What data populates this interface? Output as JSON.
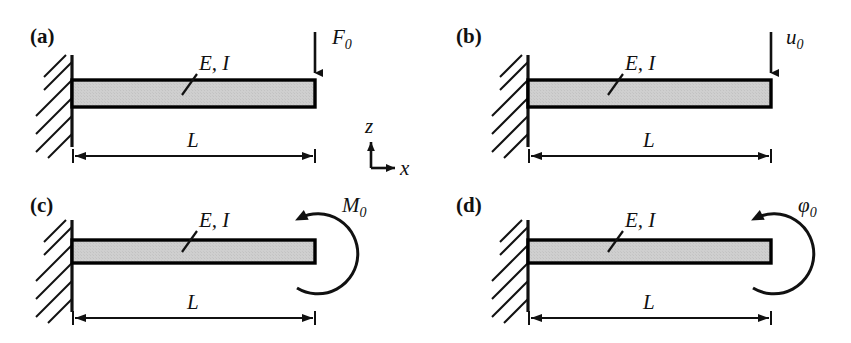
{
  "figure": {
    "type": "engineering-diagram",
    "background_color": "#ffffff",
    "ink_color": "#111111",
    "beam_fill_color": "#cccccc",
    "beam_edge_color": "#000000"
  },
  "coordinate_system": {
    "name": "coordinate-axes",
    "vertical_axis_label": "z",
    "vertical_axis_direction": "up",
    "horizontal_axis_label": "x",
    "horizontal_axis_direction": "right",
    "origin_x": 371,
    "origin_y": 158
  },
  "panels": [
    {
      "id": "a",
      "label": "(a)",
      "label_x": 30,
      "label_y": 43,
      "material_label": "E, I",
      "material_label_x": 196,
      "material_label_y": 68,
      "leader_x1": 182,
      "leader_y1": 95,
      "leader_x2": 196,
      "leader_y2": 76,
      "support": "fixed-wall",
      "wall_x": 72,
      "wall_top": 55,
      "wall_bottom": 147,
      "beam_x": 72,
      "beam_y": 80,
      "beam_width": 243,
      "beam_height": 27,
      "load": {
        "kind": "point-force",
        "symbol": "F",
        "subscript": "0",
        "label": "F0",
        "direction": "down",
        "arrow_x": 315,
        "arrow_y1": 32,
        "arrow_y2": 79,
        "label_x": 336,
        "label_y": 42
      },
      "dimension": {
        "label": "L",
        "label_x": 187,
        "label_y": 145,
        "line_y": 156,
        "x1": 73,
        "x2": 315
      }
    },
    {
      "id": "b",
      "label": "(b)",
      "label_x": 456,
      "label_y": 43,
      "material_label": "E, I",
      "material_label_x": 622,
      "material_label_y": 68,
      "leader_x1": 608,
      "leader_y1": 95,
      "leader_x2": 622,
      "leader_y2": 76,
      "support": "fixed-wall",
      "wall_x": 528,
      "wall_top": 55,
      "wall_bottom": 147,
      "beam_x": 528,
      "beam_y": 80,
      "beam_width": 243,
      "beam_height": 27,
      "load": {
        "kind": "prescribed-displacement",
        "symbol": "u",
        "subscript": "0",
        "label": "u0",
        "direction": "down",
        "arrow_x": 771,
        "arrow_y1": 32,
        "arrow_y2": 79,
        "label_x": 790,
        "label_y": 42
      },
      "dimension": {
        "label": "L",
        "label_x": 643,
        "label_y": 145,
        "line_y": 156,
        "x1": 529,
        "x2": 771
      }
    },
    {
      "id": "c",
      "label": "(c)",
      "label_x": 30,
      "label_y": 212,
      "material_label": "E, I",
      "material_label_x": 196,
      "material_label_y": 225,
      "leader_x1": 182,
      "leader_y1": 252,
      "leader_x2": 196,
      "leader_y2": 233,
      "support": "fixed-wall",
      "wall_x": 72,
      "wall_top": 222,
      "wall_bottom": 310,
      "beam_x": 72,
      "beam_y": 240,
      "beam_width": 243,
      "beam_height": 23,
      "load": {
        "kind": "moment",
        "symbol": "M",
        "subscript": "0",
        "label": "M0",
        "direction": "counterclockwise",
        "arc_cx": 315,
        "arc_cy": 252,
        "arc_r": 40,
        "label_x": 346,
        "label_y": 209
      },
      "dimension": {
        "label": "L",
        "label_x": 187,
        "label_y": 305,
        "line_y": 318,
        "x1": 73,
        "x2": 315
      }
    },
    {
      "id": "d",
      "label": "(d)",
      "label_x": 456,
      "label_y": 212,
      "material_label": "E, I",
      "material_label_x": 622,
      "material_label_y": 225,
      "leader_x1": 608,
      "leader_y1": 252,
      "leader_x2": 622,
      "leader_y2": 233,
      "support": "fixed-wall",
      "wall_x": 528,
      "wall_top": 222,
      "wall_bottom": 310,
      "beam_x": 528,
      "beam_y": 240,
      "beam_width": 243,
      "beam_height": 23,
      "load": {
        "kind": "prescribed-rotation",
        "symbol": "φ",
        "subscript": "0",
        "label": "φ0",
        "direction": "counterclockwise",
        "arc_cx": 771,
        "arc_cy": 252,
        "arc_r": 40,
        "label_x": 800,
        "label_y": 209
      },
      "dimension": {
        "label": "L",
        "label_x": 643,
        "label_y": 305,
        "line_y": 318,
        "x1": 529,
        "x2": 771
      }
    }
  ]
}
